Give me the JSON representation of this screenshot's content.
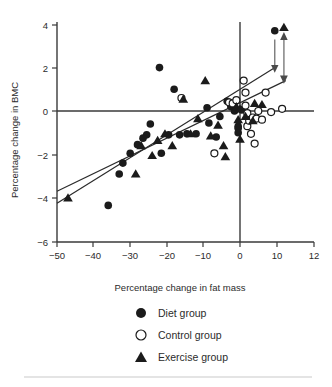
{
  "chart_data": {
    "type": "scatter",
    "title": "",
    "xlabel": "Percentage change in fat mass",
    "ylabel": "Percentage change in BMC",
    "xlim": [
      -52,
      13.5
    ],
    "ylim": [
      -6,
      4.3
    ],
    "xticks": [
      -50,
      -40,
      -30,
      -20,
      -10,
      0,
      10,
      12
    ],
    "xticklabels": [
      "−50",
      "−40",
      "−30",
      "−20",
      "−10",
      "0",
      "10",
      "12"
    ],
    "yticks": [
      4,
      2,
      0,
      -2,
      -4,
      -6
    ],
    "yticklabels": [
      "4",
      "2",
      "0",
      "−2",
      "−4",
      "−6"
    ],
    "grid": false,
    "legend_position": "below-axes",
    "reference_lines": [
      {
        "name": "y-zero-line",
        "orientation": "horizontal",
        "value": 0
      },
      {
        "name": "x-zero-line",
        "orientation": "vertical",
        "value": 0
      }
    ],
    "series": [
      {
        "name": "Diet group",
        "marker": "filled-circle",
        "color": "#1b1b1b",
        "points": [
          [
            -36.0,
            -4.35
          ],
          [
            -33.0,
            -2.9
          ],
          [
            -32.0,
            -2.4
          ],
          [
            -30.0,
            -1.95
          ],
          [
            -28.0,
            -1.55
          ],
          [
            -26.5,
            -1.25
          ],
          [
            -25.5,
            -1.1
          ],
          [
            -24.5,
            -0.6
          ],
          [
            -22.0,
            2.0
          ],
          [
            -21.5,
            -1.95
          ],
          [
            -19.5,
            -1.1
          ],
          [
            -18.0,
            1.0
          ],
          [
            -16.5,
            -1.1
          ],
          [
            -14.5,
            -1.05
          ],
          [
            -12.0,
            -1.05
          ],
          [
            -9.0,
            0.15
          ],
          [
            -8.5,
            -0.55
          ],
          [
            -6.5,
            -1.2
          ],
          [
            -5.5,
            -0.25
          ],
          [
            -3.5,
            0.45
          ],
          [
            -2.5,
            0.2
          ],
          [
            -1.5,
            0.0
          ],
          [
            -0.5,
            -0.7
          ],
          [
            -0.5,
            -0.8
          ],
          [
            -0.5,
            -1.0
          ],
          [
            0.5,
            0.05
          ],
          [
            9.5,
            3.7
          ]
        ]
      },
      {
        "name": "Control group",
        "marker": "open-circle",
        "color": "#ffffff",
        "points": [
          [
            -16.0,
            0.6
          ],
          [
            -7.0,
            -1.95
          ],
          [
            -3.0,
            0.4
          ],
          [
            -2.0,
            0.35
          ],
          [
            -1.0,
            0.5
          ],
          [
            1.0,
            1.4
          ],
          [
            1.5,
            0.85
          ],
          [
            1.5,
            0.25
          ],
          [
            2.0,
            -0.1
          ],
          [
            2.0,
            -0.7
          ],
          [
            2.5,
            -0.45
          ],
          [
            3.0,
            -1.05
          ],
          [
            3.5,
            -0.3
          ],
          [
            4.0,
            -1.5
          ],
          [
            4.5,
            -0.35
          ],
          [
            5.0,
            0.0
          ],
          [
            6.0,
            -0.4
          ],
          [
            7.0,
            0.85
          ],
          [
            8.5,
            -0.05
          ],
          [
            11.5,
            0.1
          ]
        ]
      },
      {
        "name": "Exercise group",
        "marker": "filled-triangle",
        "color": "#1b1b1b",
        "points": [
          [
            -47.0,
            -4.0
          ],
          [
            -28.5,
            -2.9
          ],
          [
            -27.0,
            -1.6
          ],
          [
            -24.0,
            -2.05
          ],
          [
            -22.5,
            -1.35
          ],
          [
            -20.5,
            -1.05
          ],
          [
            -18.5,
            -1.6
          ],
          [
            -15.5,
            0.55
          ],
          [
            -13.5,
            -1.05
          ],
          [
            -11.5,
            -0.35
          ],
          [
            -9.5,
            1.4
          ],
          [
            -8.0,
            -1.15
          ],
          [
            -6.0,
            -0.65
          ],
          [
            -4.5,
            -1.6
          ],
          [
            -4.0,
            -2.1
          ],
          [
            -1.0,
            0.2
          ],
          [
            -0.5,
            -0.4
          ],
          [
            0.0,
            0.1
          ],
          [
            0.0,
            -1.3
          ],
          [
            1.5,
            -0.25
          ],
          [
            3.5,
            -0.45
          ],
          [
            4.0,
            0.35
          ],
          [
            6.0,
            0.3
          ],
          [
            12.0,
            3.85
          ]
        ]
      }
    ],
    "regression_lines": [
      {
        "name": "steeper-fit-line",
        "x1": -50.0,
        "y1": -4.25,
        "x2": 10.0,
        "y2": 2.05
      },
      {
        "name": "shallower-fit-line",
        "x1": -50.0,
        "y1": -3.7,
        "x2": 12.5,
        "y2": 1.4
      }
    ],
    "annotations": [
      {
        "name": "diet-marker-arrow",
        "type": "single-headed-arrow",
        "x": 9.5,
        "y_from": 3.3,
        "y_to": 1.95
      },
      {
        "name": "exercise-marker-arrow",
        "type": "double-headed-arrow",
        "x": 12.0,
        "y_from": 3.45,
        "y_to": 1.45
      }
    ]
  },
  "legend": {
    "items": [
      {
        "label": "Diet group",
        "marker": "filled-circle"
      },
      {
        "label": "Control group",
        "marker": "open-circle"
      },
      {
        "label": "Exercise group",
        "marker": "filled-triangle"
      }
    ]
  }
}
